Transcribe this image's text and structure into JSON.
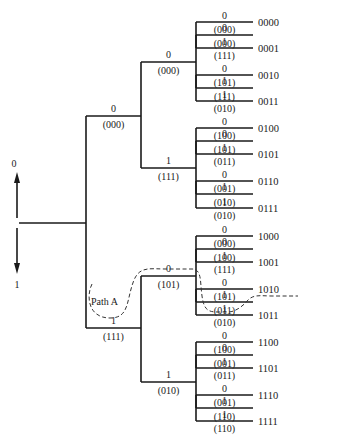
{
  "diagram": {
    "type": "code tree (binary decision tree)",
    "axis": {
      "up_label": "0",
      "down_label": "1"
    },
    "path_label": "Path A",
    "root": {
      "x": 17,
      "y": 223,
      "branch_x": 86
    },
    "levels_x": [
      86,
      141,
      196,
      253
    ],
    "nodes": [
      {
        "id": "0",
        "input": "0",
        "output": "(000)",
        "y": 116,
        "level": 0
      },
      {
        "id": "1",
        "input": "1",
        "output": "(111)",
        "y": 328,
        "level": 0
      },
      {
        "id": "00",
        "input": "0",
        "output": "(000)",
        "y": 62,
        "level": 1
      },
      {
        "id": "01",
        "input": "1",
        "output": "(111)",
        "y": 168,
        "level": 1
      },
      {
        "id": "10",
        "input": "0",
        "output": "(101)",
        "y": 276,
        "level": 1
      },
      {
        "id": "11",
        "input": "1",
        "output": "(010)",
        "y": 382,
        "level": 1
      },
      {
        "id": "000",
        "input": "0",
        "output": "(000)",
        "y": 35,
        "level": 2
      },
      {
        "id": "001",
        "input": "1",
        "output": "(111)",
        "y": 88,
        "level": 2
      },
      {
        "id": "010",
        "input": "0",
        "output": "(101)",
        "y": 141,
        "level": 2
      },
      {
        "id": "011",
        "input": "1",
        "output": "(010)",
        "y": 194,
        "level": 2
      },
      {
        "id": "100",
        "input": "0",
        "output": "(100)",
        "y": 249,
        "level": 2
      },
      {
        "id": "101",
        "input": "1",
        "output": "(011)",
        "y": 302,
        "level": 2
      },
      {
        "id": "110",
        "input": "0",
        "output": "(001)",
        "y": 355,
        "level": 2
      },
      {
        "id": "111",
        "input": "1",
        "output": "(110)",
        "y": 408,
        "level": 2
      }
    ],
    "leaves": [
      {
        "input": "0",
        "output": "(000)",
        "code": "0000",
        "y": 22
      },
      {
        "input": "1",
        "output": "(111)",
        "code": "0001",
        "y": 48
      },
      {
        "input": "0",
        "output": "(101)",
        "code": "0010",
        "y": 75
      },
      {
        "input": "1",
        "output": "(010)",
        "code": "0011",
        "y": 101
      },
      {
        "input": "0",
        "output": "(100)",
        "code": "0100",
        "y": 128
      },
      {
        "input": "1",
        "output": "(011)",
        "code": "0101",
        "y": 154
      },
      {
        "input": "0",
        "output": "(001)",
        "code": "0110",
        "y": 181
      },
      {
        "input": "1",
        "output": "(010)",
        "code": "0111",
        "y": 208
      },
      {
        "input": "0",
        "output": "(000)",
        "code": "1000",
        "y": 236
      },
      {
        "input": "1",
        "output": "(111)",
        "code": "1001",
        "y": 262
      },
      {
        "input": "0",
        "output": "(101)",
        "code": "1010",
        "y": 289
      },
      {
        "input": "1",
        "output": "(010)",
        "code": "1011",
        "y": 315
      },
      {
        "input": "0",
        "output": "(100)",
        "code": "1100",
        "y": 342
      },
      {
        "input": "1",
        "output": "(011)",
        "code": "1101",
        "y": 368
      },
      {
        "input": "0",
        "output": "(001)",
        "code": "1110",
        "y": 395
      },
      {
        "input": "1",
        "output": "(110)",
        "code": "1111",
        "y": 421
      }
    ],
    "highlighted_path": {
      "name": "Path A",
      "sequence": "1010"
    }
  }
}
